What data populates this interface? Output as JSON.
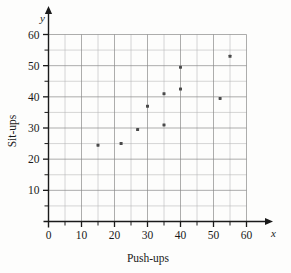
{
  "chart_data": {
    "type": "scatter",
    "title": "",
    "xlabel": "Push-ups",
    "ylabel": "Sit-ups",
    "x_axis_variable": "x",
    "y_axis_variable": "y",
    "xlim": [
      0,
      62
    ],
    "ylim": [
      0,
      64
    ],
    "grid": true,
    "grid_major_step": 10,
    "grid_minor_step": 5,
    "legend": "none",
    "x_ticks": [
      0,
      10,
      20,
      30,
      40,
      50,
      60
    ],
    "x_tick_labels": [
      "0",
      "10",
      "20",
      "30",
      "40",
      "50",
      "60"
    ],
    "x_minor_ticks": [
      5,
      15,
      25,
      35,
      45,
      55
    ],
    "y_ticks": [
      10,
      20,
      30,
      40,
      50,
      60
    ],
    "y_tick_labels": [
      "10",
      "20",
      "30",
      "40",
      "50",
      "60"
    ],
    "y_minor_ticks": [
      5,
      15,
      25,
      35,
      45,
      55
    ],
    "points": [
      {
        "x": 15,
        "y": 24.5
      },
      {
        "x": 22,
        "y": 25
      },
      {
        "x": 27,
        "y": 29.5
      },
      {
        "x": 30,
        "y": 37
      },
      {
        "x": 35,
        "y": 31
      },
      {
        "x": 35,
        "y": 41
      },
      {
        "x": 40,
        "y": 42.5
      },
      {
        "x": 40,
        "y": 49.5
      },
      {
        "x": 52,
        "y": 39.5
      },
      {
        "x": 55,
        "y": 53
      }
    ],
    "marker": "square-dot",
    "marker_color": "#4a4a4a",
    "grid_color": "#8a8a8a",
    "axis_color": "#1a1a1a"
  }
}
